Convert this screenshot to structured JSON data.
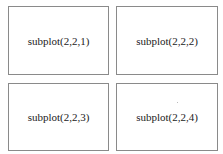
{
  "figure": {
    "layout": {
      "rows": 2,
      "cols": 2
    },
    "panels": [
      {
        "label": "subplot(2,2,1)"
      },
      {
        "label": "subplot(2,2,2)"
      },
      {
        "label": "subplot(2,2,3)"
      },
      {
        "label": "subplot(2,2,4)"
      }
    ],
    "border_color": "#8a8a8a",
    "background_color": "#ffffff"
  }
}
